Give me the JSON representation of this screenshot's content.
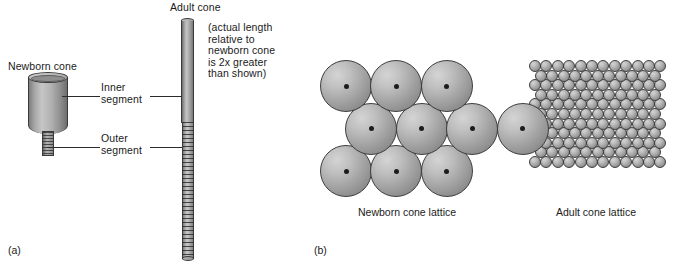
{
  "figure": {
    "panel_a": {
      "tag": "(a)",
      "newborn_cone_label": "Newborn cone",
      "adult_cone_label": "Adult cone",
      "note": "(actual length\nrelative to\nnewborn cone\nis  2x greater\nthan shown)",
      "callouts": [
        {
          "label": "Inner\nsegment"
        },
        {
          "label": "Outer\nsegment"
        }
      ]
    },
    "panel_b": {
      "tag": "(b)",
      "newborn_lattice_caption": "Newborn cone lattice",
      "adult_lattice_caption": "Adult cone lattice"
    }
  },
  "chart_data": {
    "type": "diagram",
    "panels": [
      {
        "id": "a",
        "tag": "(a)",
        "description": "Side views of a single cone photoreceptor in the newborn and the adult retina, showing the inner segment and outer segment.",
        "objects": [
          {
            "name": "Newborn cone",
            "shape": "short wide cylinder with narrow ridged stem",
            "inner_segment": {
              "width_px": 40,
              "height_px": 57,
              "shape": "broad cylinder"
            },
            "outer_segment": {
              "width_px": 12,
              "height_px": 25,
              "shape": "narrow ridged stalk"
            }
          },
          {
            "name": "Adult cone",
            "shape": "long slender rod",
            "inner_segment": {
              "width_px": 13,
              "height_px": 104,
              "shape": "smooth slender rod"
            },
            "outer_segment": {
              "width_px": 12,
              "height_px": 137,
              "shape": "long ridged rod"
            },
            "note": "(actual length relative to newborn cone is  2x greater than shown)",
            "scale_factor_actual_vs_shown": 2
          }
        ]
      },
      {
        "id": "b",
        "tag": "(b)",
        "description": "Face-on views of the cone mosaic, comparing sparse large newborn cones to the dense small adult cone packing.",
        "lattices": [
          {
            "name": "Newborn cone lattice",
            "caption": "Newborn cone lattice",
            "packing": "hexagonal",
            "rows": 3,
            "cells_per_row": [
              3,
              4,
              3
            ],
            "total_cells": 10,
            "cell_diameter_px": 52,
            "has_center_dot": true
          },
          {
            "name": "Adult cone lattice",
            "caption": "Adult cone lattice",
            "packing": "hexagonal",
            "rows": 11,
            "cells_per_row": [
              12,
              11,
              12,
              11,
              12,
              11,
              12,
              11,
              12,
              11,
              12
            ],
            "total_cells": 127,
            "cell_diameter_px": 12,
            "has_center_dot": false
          }
        ]
      }
    ],
    "colors": {
      "cell_fill_light": "#d4d4d4",
      "cell_fill_dark": "#7b7b7b",
      "outline": "#3d3d3d",
      "center_dot": "#1c1c1c",
      "text": "#1a1a1a",
      "background": "#ffffff"
    }
  }
}
